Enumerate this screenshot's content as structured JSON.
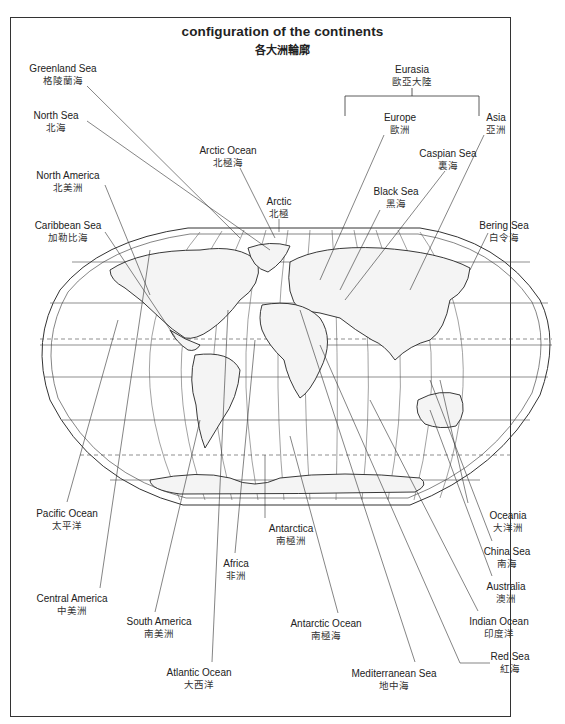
{
  "title": "configuration of the continents",
  "subtitle": "各大洲輪廓",
  "group": {
    "label_en": "Eurasia",
    "label_zh": "歐亞大陸",
    "members": [
      "Europe",
      "Asia"
    ]
  },
  "labels": [
    {
      "id": "greenland-sea",
      "en": "Greenland Sea",
      "zh": "格陵蘭海",
      "x": 63,
      "y": 63
    },
    {
      "id": "north-sea",
      "en": "North Sea",
      "zh": "北海",
      "x": 56,
      "y": 110
    },
    {
      "id": "north-america",
      "en": "North America",
      "zh": "北美洲",
      "x": 68,
      "y": 170
    },
    {
      "id": "caribbean-sea",
      "en": "Caribbean Sea",
      "zh": "加勒比海",
      "x": 68,
      "y": 220
    },
    {
      "id": "arctic-ocean",
      "en": "Arctic Ocean",
      "zh": "北極海",
      "x": 228,
      "y": 145
    },
    {
      "id": "arctic",
      "en": "Arctic",
      "zh": "北極",
      "x": 279,
      "y": 196
    },
    {
      "id": "eurasia",
      "en": "Eurasia",
      "zh": "歐亞大陸",
      "x": 412,
      "y": 66
    },
    {
      "id": "europe",
      "en": "Europe",
      "zh": "歐洲",
      "x": 400,
      "y": 112
    },
    {
      "id": "asia",
      "en": "Asia",
      "zh": "亞洲",
      "x": 496,
      "y": 112
    },
    {
      "id": "caspian-sea",
      "en": "Caspian Sea",
      "zh": "裏海",
      "x": 448,
      "y": 148
    },
    {
      "id": "black-sea",
      "en": "Black Sea",
      "zh": "黑海",
      "x": 396,
      "y": 186
    },
    {
      "id": "bering-sea",
      "en": "Bering Sea",
      "zh": "白令海",
      "x": 504,
      "y": 220
    },
    {
      "id": "pacific-ocean",
      "en": "Pacific Ocean",
      "zh": "太平洋",
      "x": 67,
      "y": 508
    },
    {
      "id": "central-america",
      "en": "Central America",
      "zh": "中美洲",
      "x": 72,
      "y": 593
    },
    {
      "id": "south-america",
      "en": "South America",
      "zh": "南美洲",
      "x": 159,
      "y": 616
    },
    {
      "id": "africa",
      "en": "Africa",
      "zh": "非洲",
      "x": 236,
      "y": 558
    },
    {
      "id": "atlantic-ocean",
      "en": "Atlantic Ocean",
      "zh": "大西洋",
      "x": 199,
      "y": 667
    },
    {
      "id": "antarctica",
      "en": "Antarctica",
      "zh": "南極洲",
      "x": 291,
      "y": 523
    },
    {
      "id": "antarctic-ocean",
      "en": "Antarctic Ocean",
      "zh": "南極海",
      "x": 326,
      "y": 618
    },
    {
      "id": "mediterranean-sea",
      "en": "Mediterranean Sea",
      "zh": "地中海",
      "x": 394,
      "y": 668
    },
    {
      "id": "oceania",
      "en": "Oceania",
      "zh": "大洋洲",
      "x": 508,
      "y": 510
    },
    {
      "id": "china-sea",
      "en": "China Sea",
      "zh": "南海",
      "x": 507,
      "y": 546
    },
    {
      "id": "australia",
      "en": "Australia",
      "zh": "澳洲",
      "x": 506,
      "y": 581
    },
    {
      "id": "indian-ocean",
      "en": "Indian Ocean",
      "zh": "印度洋",
      "x": 499,
      "y": 616
    },
    {
      "id": "red-sea",
      "en": "Red Sea",
      "zh": "紅海",
      "x": 510,
      "y": 651
    }
  ],
  "graticule_labels": {
    "top": [
      "180°",
      "160°",
      "140°",
      "120°",
      "100°",
      "80°",
      "60°",
      "40°",
      "20°",
      "0°",
      "20°",
      "40°",
      "60°",
      "80°",
      "100°",
      "120°",
      "140°",
      "160°"
    ],
    "latitudes": [
      "80°",
      "60°",
      "40°",
      "20°",
      "0°",
      "20°",
      "40°",
      "60°",
      "80°"
    ]
  },
  "colors": {
    "ink": "#222222",
    "background": "#ffffff",
    "land_shade": "#bbbbbb"
  }
}
